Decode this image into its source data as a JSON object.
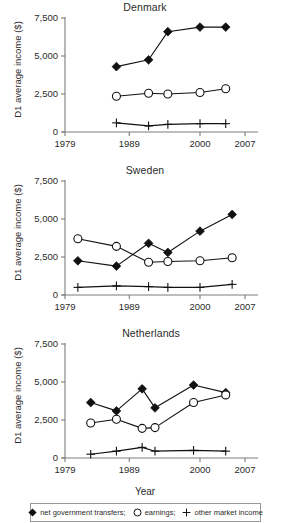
{
  "figure": {
    "xlabel": "Year",
    "ylabel": "D1 average income ($)"
  },
  "legend": {
    "items": [
      {
        "label": "net government transfers;",
        "marker": "filled-diamond-icon",
        "key": "transfers"
      },
      {
        "label": "earnings;",
        "marker": "open-circle-icon",
        "key": "earnings"
      },
      {
        "label": "other market income",
        "marker": "plus-icon",
        "key": "other"
      }
    ]
  },
  "axes": {
    "y_ticks": [
      "0",
      "2,500",
      "5,000",
      "7,500"
    ],
    "y_tick_values": [
      0,
      2500,
      5000,
      7500
    ],
    "x_ticks": [
      "1979",
      "1989",
      "2000",
      "2007"
    ],
    "x_tick_values": [
      1979,
      1989,
      2000,
      2007
    ],
    "xlim": [
      1979,
      2007
    ],
    "ylim": [
      0,
      7500
    ],
    "grid": false
  },
  "chart_data": [
    {
      "type": "line",
      "title": "Denmark",
      "xlabel": "",
      "ylabel": "D1 average income ($)",
      "xlim": [
        1979,
        2007
      ],
      "ylim": [
        0,
        7500
      ],
      "grid": false,
      "legend_position": "bottom",
      "x": [
        1987,
        1992,
        1995,
        2000,
        2004
      ],
      "series": [
        {
          "name": "net government transfers",
          "marker": "filled-diamond",
          "values": [
            4300,
            4750,
            6600,
            6900,
            6900
          ]
        },
        {
          "name": "earnings",
          "marker": "open-circle",
          "values": [
            2350,
            2550,
            2500,
            2600,
            2850
          ]
        },
        {
          "name": "other market income",
          "marker": "plus",
          "values": [
            600,
            400,
            500,
            550,
            550
          ]
        }
      ]
    },
    {
      "type": "line",
      "title": "Sweden",
      "xlabel": "",
      "ylabel": "D1 average income ($)",
      "xlim": [
        1979,
        2007
      ],
      "ylim": [
        0,
        7500
      ],
      "grid": false,
      "legend_position": "bottom",
      "x": [
        1981,
        1987,
        1992,
        1995,
        2000,
        2005
      ],
      "series": [
        {
          "name": "net government transfers",
          "marker": "filled-diamond",
          "values": [
            2250,
            1900,
            3400,
            2800,
            4200,
            5300
          ]
        },
        {
          "name": "earnings",
          "marker": "open-circle",
          "values": [
            3700,
            3200,
            2150,
            2200,
            2250,
            2450
          ]
        },
        {
          "name": "other market income",
          "marker": "plus",
          "values": [
            500,
            600,
            550,
            500,
            500,
            700
          ]
        }
      ]
    },
    {
      "type": "line",
      "title": "Netherlands",
      "xlabel": "Year",
      "ylabel": "D1 average income ($)",
      "xlim": [
        1979,
        2007
      ],
      "ylim": [
        0,
        7500
      ],
      "grid": false,
      "legend_position": "bottom",
      "x": [
        1983,
        1987,
        1991,
        1993,
        1999,
        2004
      ],
      "series": [
        {
          "name": "net government transfers",
          "marker": "filled-diamond",
          "values": [
            3650,
            3100,
            4550,
            3300,
            4800,
            4300
          ]
        },
        {
          "name": "earnings",
          "marker": "open-circle",
          "values": [
            2300,
            2550,
            1950,
            2000,
            3650,
            4150
          ]
        },
        {
          "name": "other market income",
          "marker": "plus",
          "values": [
            250,
            450,
            700,
            450,
            500,
            450
          ]
        }
      ]
    }
  ]
}
